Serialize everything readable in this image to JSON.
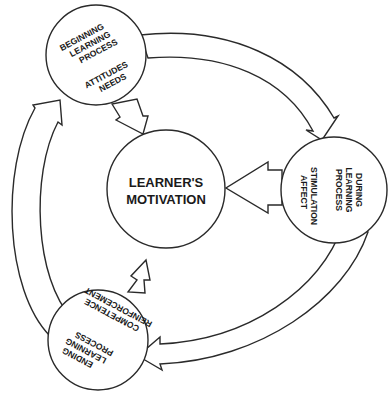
{
  "diagram": {
    "center": {
      "line1": "LEARNER'S",
      "line2": "MOTIVATION"
    },
    "beginning": {
      "stage": [
        "BEGINNING",
        "LEARNING",
        "PROCESS"
      ],
      "factors": [
        "ATTITUDES",
        "NEEDS"
      ]
    },
    "during": {
      "stage": [
        "DURING",
        "LEARNING",
        "PROCESS"
      ],
      "factors": [
        "STIMULATION",
        "AFFECT"
      ]
    },
    "ending": {
      "stage": [
        "ENDING",
        "LEARNING",
        "PROCESS"
      ],
      "factors": [
        "COMPETENCE",
        "REINFORCEMENT"
      ]
    },
    "colors": {
      "line": "#2a2a2a",
      "text": "#1a1a1a",
      "background": "#ffffff"
    }
  }
}
